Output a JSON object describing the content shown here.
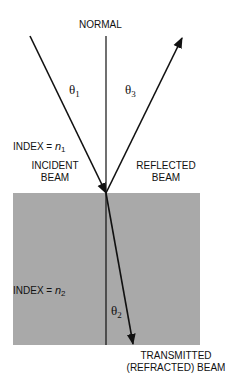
{
  "diagram": {
    "normal_label": "NORMAL",
    "theta1": {
      "symbol": "θ",
      "sub": "1"
    },
    "theta3": {
      "symbol": "θ",
      "sub": "3"
    },
    "theta2": {
      "symbol": "θ",
      "sub": "2"
    },
    "index1": {
      "prefix": "INDEX = ",
      "var": "n",
      "sub": "1"
    },
    "index2": {
      "prefix": "INDEX = ",
      "var": "n",
      "sub": "2"
    },
    "incident_label": {
      "line1": "INCIDENT",
      "line2": "BEAM"
    },
    "reflected_label": {
      "line1": "REFLECTED",
      "line2": "BEAM"
    },
    "transmitted_label": {
      "line1": "TRANSMITTED",
      "line2": "(REFRACTED) BEAM"
    },
    "colors": {
      "medium": "#a9a9a9",
      "lines": "#111111",
      "background": "#ffffff"
    }
  }
}
